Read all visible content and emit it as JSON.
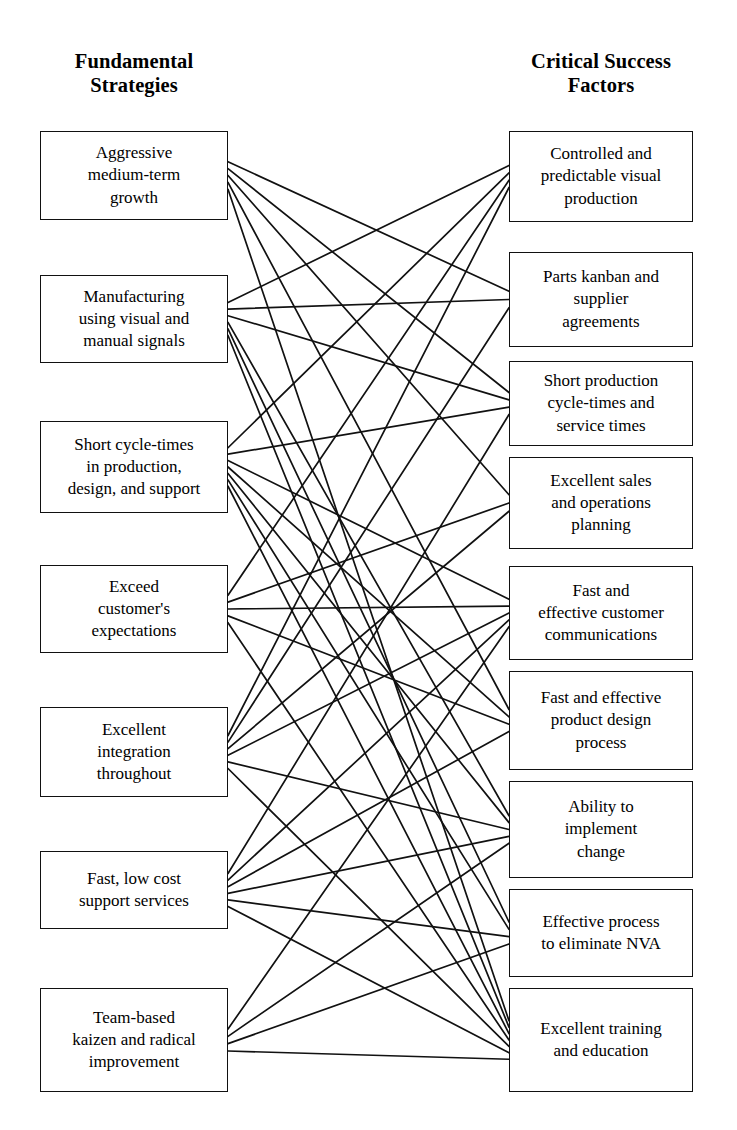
{
  "page": {
    "background_color": "#ffffff",
    "line_color": "#111111",
    "box_border_color": "#111111",
    "text_color": "#000000",
    "width": 737,
    "height": 1130
  },
  "headings": {
    "left": "Fundamental\nStrategies",
    "right": "Critical Success\nFactors"
  },
  "left_column": {
    "title": "Fundamental Strategies",
    "items": [
      {
        "id": "L1",
        "label": "Aggressive\nmedium-term\ngrowth"
      },
      {
        "id": "L2",
        "label": "Manufacturing\nusing visual and\nmanual signals"
      },
      {
        "id": "L3",
        "label": "Short cycle-times\nin production,\ndesign, and support"
      },
      {
        "id": "L4",
        "label": "Exceed\ncustomer's\nexpectations"
      },
      {
        "id": "L5",
        "label": "Excellent\nintegration\nthroughout"
      },
      {
        "id": "L6",
        "label": "Fast, low cost\nsupport services"
      },
      {
        "id": "L7",
        "label": "Team-based\nkaizen and radical\nimprovement"
      }
    ]
  },
  "right_column": {
    "title": "Critical Success Factors",
    "items": [
      {
        "id": "R1",
        "label": "Controlled and\npredictable visual\nproduction"
      },
      {
        "id": "R2",
        "label": "Parts kanban and\nsupplier\nagreements"
      },
      {
        "id": "R3",
        "label": "Short production\ncycle-times and\nservice times"
      },
      {
        "id": "R4",
        "label": "Excellent sales\nand operations\nplanning"
      },
      {
        "id": "R5",
        "label": "Fast and\neffective customer\ncommunications"
      },
      {
        "id": "R6",
        "label": "Fast and effective\nproduct design\nprocess"
      },
      {
        "id": "R7",
        "label": "Ability to\nimplement\nchange"
      },
      {
        "id": "R8",
        "label": "Effective process\nto eliminate NVA"
      },
      {
        "id": "R9",
        "label": "Excellent training\nand education"
      }
    ]
  },
  "chart_data": {
    "type": "diagram",
    "subtype": "bipartite-relationship-matrix",
    "left_nodes": [
      "Aggressive medium-term growth",
      "Manufacturing using visual and manual signals",
      "Short cycle-times in production, design, and support",
      "Exceed customer's expectations",
      "Excellent integration throughout",
      "Fast, low cost support services",
      "Team-based kaizen and radical improvement"
    ],
    "right_nodes": [
      "Controlled and predictable visual production",
      "Parts kanban and supplier agreements",
      "Short production cycle-times and service times",
      "Excellent sales and operations planning",
      "Fast and effective customer communications",
      "Fast and effective product design process",
      "Ability to implement change",
      "Effective process to eliminate NVA",
      "Excellent training and education"
    ],
    "edges": [
      [
        "L1",
        "R2"
      ],
      [
        "L1",
        "R3"
      ],
      [
        "L1",
        "R4"
      ],
      [
        "L1",
        "R6"
      ],
      [
        "L1",
        "R9"
      ],
      [
        "L2",
        "R1"
      ],
      [
        "L2",
        "R2"
      ],
      [
        "L2",
        "R3"
      ],
      [
        "L2",
        "R7"
      ],
      [
        "L2",
        "R8"
      ],
      [
        "L2",
        "R9"
      ],
      [
        "L3",
        "R1"
      ],
      [
        "L3",
        "R3"
      ],
      [
        "L3",
        "R5"
      ],
      [
        "L3",
        "R6"
      ],
      [
        "L3",
        "R7"
      ],
      [
        "L3",
        "R8"
      ],
      [
        "L3",
        "R9"
      ],
      [
        "L4",
        "R1"
      ],
      [
        "L4",
        "R4"
      ],
      [
        "L4",
        "R5"
      ],
      [
        "L4",
        "R6"
      ],
      [
        "L4",
        "R9"
      ],
      [
        "L5",
        "R1"
      ],
      [
        "L5",
        "R2"
      ],
      [
        "L5",
        "R4"
      ],
      [
        "L5",
        "R5"
      ],
      [
        "L5",
        "R7"
      ],
      [
        "L5",
        "R9"
      ],
      [
        "L6",
        "R3"
      ],
      [
        "L6",
        "R5"
      ],
      [
        "L6",
        "R6"
      ],
      [
        "L6",
        "R7"
      ],
      [
        "L6",
        "R8"
      ],
      [
        "L6",
        "R9"
      ],
      [
        "L7",
        "R5"
      ],
      [
        "L7",
        "R7"
      ],
      [
        "L7",
        "R8"
      ],
      [
        "L7",
        "R9"
      ]
    ],
    "edge_count": 39,
    "geometry": {
      "left_box": {
        "x": 40,
        "width": 188
      },
      "right_box": {
        "x": 509,
        "width": 184
      },
      "left_rows_y": [
        131,
        275,
        421,
        565,
        707,
        851,
        988
      ],
      "left_rows_h": [
        89,
        88,
        92,
        88,
        90,
        78,
        104
      ],
      "right_rows_y": [
        131,
        252,
        361,
        457,
        566,
        671,
        781,
        889,
        988
      ],
      "right_rows_h": [
        91,
        95,
        85,
        92,
        94,
        99,
        97,
        88,
        104
      ]
    }
  }
}
